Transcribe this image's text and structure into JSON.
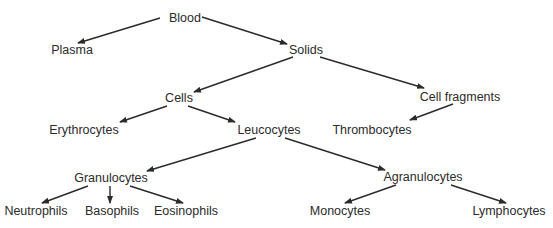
{
  "diagram": {
    "type": "hierarchy-tree",
    "nodes": {
      "blood": {
        "label": "Blood",
        "x": 185,
        "y": 18
      },
      "plasma": {
        "label": "Plasma",
        "x": 72,
        "y": 50
      },
      "solids": {
        "label": "Solids",
        "x": 306,
        "y": 50
      },
      "cells": {
        "label": "Cells",
        "x": 179,
        "y": 98
      },
      "cell_fragments": {
        "label": "Cell fragments",
        "x": 460,
        "y": 97
      },
      "erythrocytes": {
        "label": "Erythrocytes",
        "x": 84,
        "y": 130
      },
      "leucocytes": {
        "label": "Leucocytes",
        "x": 269,
        "y": 130
      },
      "thrombocytes": {
        "label": "Thrombocytes",
        "x": 372,
        "y": 130
      },
      "granulocytes": {
        "label": "Granulocytes",
        "x": 111,
        "y": 178
      },
      "agranulocytes": {
        "label": "Agranulocytes",
        "x": 423,
        "y": 177
      },
      "neutrophils": {
        "label": "Neutrophils",
        "x": 36,
        "y": 211
      },
      "basophils": {
        "label": "Basophils",
        "x": 112,
        "y": 211
      },
      "eosinophils": {
        "label": "Eosinophils",
        "x": 186,
        "y": 211
      },
      "monocytes": {
        "label": "Monocytes",
        "x": 340,
        "y": 211
      },
      "lymphocytes": {
        "label": "Lymphocytes",
        "x": 509,
        "y": 211
      }
    },
    "edges": [
      {
        "from": "blood",
        "to": "plasma",
        "x1": 160,
        "y1": 18,
        "x2": 78,
        "y2": 43
      },
      {
        "from": "blood",
        "to": "solids",
        "x1": 202,
        "y1": 17,
        "x2": 287,
        "y2": 44
      },
      {
        "from": "solids",
        "to": "cells",
        "x1": 293,
        "y1": 57,
        "x2": 194,
        "y2": 92
      },
      {
        "from": "solids",
        "to": "cell_fragments",
        "x1": 320,
        "y1": 57,
        "x2": 424,
        "y2": 88
      },
      {
        "from": "cells",
        "to": "erythrocytes",
        "x1": 167,
        "y1": 106,
        "x2": 120,
        "y2": 122
      },
      {
        "from": "cells",
        "to": "leucocytes",
        "x1": 188,
        "y1": 106,
        "x2": 235,
        "y2": 122
      },
      {
        "from": "cell_fragments",
        "to": "thrombocytes",
        "x1": 453,
        "y1": 104,
        "x2": 410,
        "y2": 120
      },
      {
        "from": "leucocytes",
        "to": "granulocytes",
        "x1": 256,
        "y1": 138,
        "x2": 147,
        "y2": 171
      },
      {
        "from": "leucocytes",
        "to": "agranulocytes",
        "x1": 285,
        "y1": 138,
        "x2": 385,
        "y2": 170
      },
      {
        "from": "granulocytes",
        "to": "neutrophils",
        "x1": 88,
        "y1": 186,
        "x2": 42,
        "y2": 203
      },
      {
        "from": "granulocytes",
        "to": "basophils",
        "x1": 110,
        "y1": 186,
        "x2": 110,
        "y2": 203
      },
      {
        "from": "granulocytes",
        "to": "eosinophils",
        "x1": 130,
        "y1": 186,
        "x2": 183,
        "y2": 203
      },
      {
        "from": "agranulocytes",
        "to": "monocytes",
        "x1": 396,
        "y1": 185,
        "x2": 345,
        "y2": 203
      },
      {
        "from": "agranulocytes",
        "to": "lymphocytes",
        "x1": 451,
        "y1": 185,
        "x2": 506,
        "y2": 203
      }
    ],
    "colors": {
      "line": "#2b2b2b",
      "text": "#2b2b2b",
      "background": "#ffffff"
    }
  }
}
